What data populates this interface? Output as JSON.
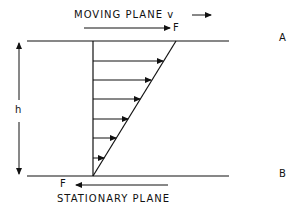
{
  "top_label": "MOVING PLANE v",
  "top_force": "F",
  "bottom_force": "F",
  "bottom_label": "STATIONARY PLANE",
  "plane_a": "A",
  "plane_b": "B",
  "height_label": "h",
  "profile": {
    "arrow_count": 6,
    "type": "linear velocity profile (Couette flow)"
  }
}
